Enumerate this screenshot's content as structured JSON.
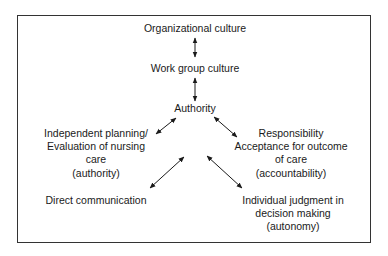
{
  "diagram": {
    "type": "concept-flow",
    "nodes": {
      "organizational_culture": {
        "lines": [
          "Organizational culture"
        ]
      },
      "work_group_culture": {
        "lines": [
          "Work group culture"
        ]
      },
      "authority": {
        "lines": [
          "Authority"
        ]
      },
      "independent_planning": {
        "lines": [
          "Independent planning/",
          "Evaluation of nursing",
          "care",
          "(authority)"
        ]
      },
      "responsibility": {
        "lines": [
          "Responsibility",
          "Acceptance for outcome",
          "of care",
          "(accountability)"
        ]
      },
      "direct_communication": {
        "lines": [
          "Direct communication"
        ]
      },
      "individual_judgment": {
        "lines": [
          "Individual judgment in",
          "decision making",
          "(autonomy)"
        ]
      }
    },
    "edges": [
      {
        "from": "organizational_culture",
        "to": "work_group_culture",
        "style": "bidirectional"
      },
      {
        "from": "work_group_culture",
        "to": "authority",
        "style": "bidirectional"
      },
      {
        "from": "authority",
        "to": "independent_planning",
        "style": "bidirectional"
      },
      {
        "from": "authority",
        "to": "responsibility",
        "style": "bidirectional"
      },
      {
        "from": "authority",
        "to": "direct_communication",
        "style": "bidirectional"
      },
      {
        "from": "authority",
        "to": "individual_judgment",
        "style": "bidirectional"
      }
    ],
    "colors": {
      "line": "#1a1a1a",
      "border": "#333333",
      "background": "#ffffff"
    }
  }
}
